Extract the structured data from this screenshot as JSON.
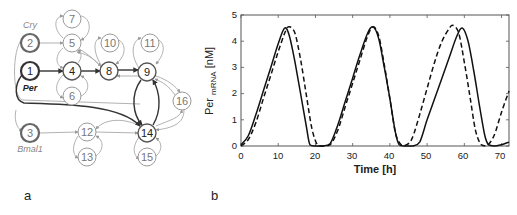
{
  "panel_a": {
    "label": "a",
    "gene_labels": {
      "node2": "Cry",
      "node1": "Per",
      "node3": "Bmal1"
    },
    "nodes": [
      {
        "id": "1",
        "x": 30,
        "y": 71,
        "style": "thick"
      },
      {
        "id": "2",
        "x": 30,
        "y": 43,
        "style": "thick-gray"
      },
      {
        "id": "3",
        "x": 30,
        "y": 133,
        "style": "thick-gray"
      },
      {
        "id": "4",
        "x": 72,
        "y": 71,
        "style": "mid"
      },
      {
        "id": "5",
        "x": 72,
        "y": 43,
        "style": "thin"
      },
      {
        "id": "6",
        "x": 72,
        "y": 96,
        "style": "thin"
      },
      {
        "id": "7",
        "x": 72,
        "y": 19,
        "style": "thin"
      },
      {
        "id": "8",
        "x": 109,
        "y": 71,
        "style": "mid"
      },
      {
        "id": "9",
        "x": 147,
        "y": 72,
        "style": "mid"
      },
      {
        "id": "10",
        "x": 110,
        "y": 43,
        "style": "thin"
      },
      {
        "id": "11",
        "x": 150,
        "y": 43,
        "style": "thin"
      },
      {
        "id": "12",
        "x": 87,
        "y": 132,
        "style": "thin"
      },
      {
        "id": "13",
        "x": 87,
        "y": 157,
        "style": "thin"
      },
      {
        "id": "14",
        "x": 147,
        "y": 133,
        "style": "mid"
      },
      {
        "id": "15",
        "x": 147,
        "y": 157,
        "style": "thin"
      },
      {
        "id": "16",
        "x": 182,
        "y": 101,
        "style": "thin"
      }
    ]
  },
  "panel_b": {
    "label": "b"
  },
  "chart_data": {
    "type": "line",
    "title": "",
    "xlabel": "Time [h]",
    "ylabel": "Per mRNA [nM]",
    "ylabel_main": "Per",
    "ylabel_sub": "mRNA",
    "ylabel_unit": "[nM]",
    "xlim": [
      0,
      72
    ],
    "ylim": [
      0,
      5
    ],
    "xticks": [
      "0",
      "10",
      "20",
      "30",
      "40",
      "50",
      "60",
      "70"
    ],
    "yticks": [
      "0",
      "1",
      "2",
      "3",
      "4",
      "5"
    ],
    "grid": false,
    "legend": null,
    "series": [
      {
        "name": "solid",
        "style": "solid",
        "x": [
          0,
          2,
          4,
          6,
          8,
          10,
          11.7,
          13,
          14.5,
          16,
          17.5,
          18.5,
          20,
          22,
          24,
          26,
          28,
          30,
          32,
          34,
          35.5,
          37,
          38.5,
          40,
          41.5,
          42.5,
          44,
          46,
          48,
          50,
          52,
          54,
          56,
          58,
          59.5,
          61,
          62.5,
          64,
          65.5,
          66.5,
          68,
          70,
          72
        ],
        "values": [
          0.05,
          0.4,
          1.2,
          2.1,
          3.0,
          3.9,
          4.5,
          4.2,
          3.2,
          2.0,
          0.8,
          0.05,
          0.0,
          0.0,
          0.1,
          0.8,
          1.7,
          2.6,
          3.5,
          4.3,
          4.55,
          4.1,
          3.0,
          1.8,
          0.5,
          0.05,
          0.0,
          0.0,
          0.15,
          1.0,
          1.8,
          2.6,
          3.4,
          4.2,
          4.5,
          4.0,
          2.9,
          1.6,
          0.4,
          0.05,
          0.0,
          0.05,
          0.15
        ]
      },
      {
        "name": "dashed",
        "style": "dashed",
        "x": [
          0,
          2,
          4,
          6,
          8,
          10,
          12,
          13,
          14.5,
          16,
          17.5,
          19,
          20.5,
          22,
          24,
          26,
          28,
          30,
          32,
          34,
          35.5,
          37,
          38.5,
          40,
          41.5,
          43,
          44.5,
          46,
          48,
          50,
          52,
          54,
          56,
          57,
          58.5,
          60,
          61.5,
          63,
          64.5,
          66,
          68,
          70,
          72
        ],
        "values": [
          0.0,
          0.25,
          0.9,
          1.8,
          2.7,
          3.6,
          4.4,
          4.55,
          4.3,
          3.3,
          2.0,
          0.7,
          0.05,
          0.0,
          0.05,
          0.6,
          1.5,
          2.4,
          3.3,
          4.2,
          4.55,
          4.2,
          3.1,
          1.8,
          0.5,
          0.05,
          0.05,
          0.3,
          1.2,
          2.2,
          3.2,
          4.0,
          4.5,
          4.6,
          4.3,
          3.2,
          1.9,
          0.6,
          0.05,
          0.0,
          0.4,
          1.3,
          2.1
        ]
      }
    ]
  }
}
